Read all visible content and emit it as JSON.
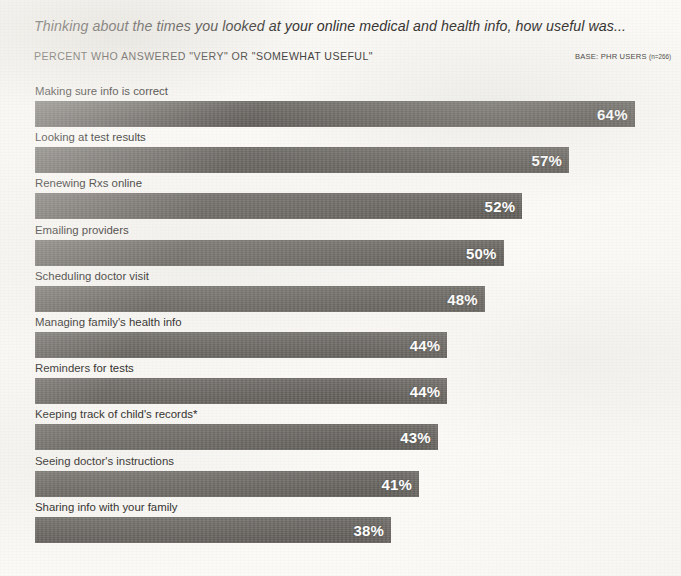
{
  "header": {
    "title": "Thinking about the times you looked at your online medical and health info, how useful was...",
    "subtitle": "PERCENT WHO ANSWERED \"VERY\" OR \"SOMEWHAT USEFUL\"",
    "base_label": "BASE: PHR USERS",
    "base_n": "(n=266)"
  },
  "colors": {
    "bar": "#67645f",
    "background": "#fbfaf7",
    "label_text": "#262422",
    "value_text": "#ffffff"
  },
  "chart_data": {
    "type": "bar",
    "orientation": "horizontal",
    "title": "Thinking about the times you looked at your online medical and health info, how useful was...",
    "subtitle": "PERCENT WHO ANSWERED \"VERY\" OR \"SOMEWHAT USEFUL\"",
    "annotations": [
      "BASE: PHR USERS (n=266)",
      "* Keeping track of child's records"
    ],
    "xlabel": "",
    "ylabel": "",
    "xlim": [
      0,
      68
    ],
    "grid": false,
    "legend": null,
    "value_suffix": "%",
    "categories": [
      "Making sure info is correct",
      "Looking at test results",
      "Renewing Rxs online",
      "Emailing providers",
      "Scheduling doctor visit",
      "Managing family's health info",
      "Reminders for tests",
      "Keeping track of child's records*",
      "Seeing doctor's instructions",
      "Sharing info with your family"
    ],
    "values": [
      64,
      57,
      52,
      50,
      48,
      44,
      44,
      43,
      41,
      38
    ],
    "value_labels": [
      "64%",
      "57%",
      "52%",
      "50%",
      "48%",
      "44%",
      "44%",
      "43%",
      "41%",
      "38%"
    ],
    "bars": [
      {
        "label": "Making sure info is correct",
        "value": 64,
        "value_label": "64%"
      },
      {
        "label": "Looking at test results",
        "value": 57,
        "value_label": "57%"
      },
      {
        "label": "Renewing Rxs online",
        "value": 52,
        "value_label": "52%"
      },
      {
        "label": "Emailing providers",
        "value": 50,
        "value_label": "50%"
      },
      {
        "label": "Scheduling doctor visit",
        "value": 48,
        "value_label": "48%"
      },
      {
        "label": "Managing family's health info",
        "value": 44,
        "value_label": "44%"
      },
      {
        "label": "Reminders for tests",
        "value": 44,
        "value_label": "44%"
      },
      {
        "label": "Keeping track of child's records*",
        "value": 43,
        "value_label": "43%"
      },
      {
        "label": "Seeing doctor's instructions",
        "value": 41,
        "value_label": "41%"
      },
      {
        "label": "Sharing info with your family",
        "value": 38,
        "value_label": "38%"
      }
    ]
  }
}
